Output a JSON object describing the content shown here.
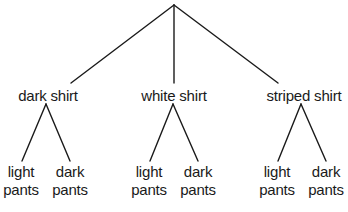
{
  "diagram": {
    "type": "tree",
    "line_color": "#1a1a1a",
    "root": {
      "label": ""
    },
    "shirts": [
      {
        "label": "dark shirt",
        "children": [
          {
            "line1": "light",
            "line2": "pants"
          },
          {
            "line1": "dark",
            "line2": "pants"
          }
        ]
      },
      {
        "label": "white shirt",
        "children": [
          {
            "line1": "light",
            "line2": "pants"
          },
          {
            "line1": "dark",
            "line2": "pants"
          }
        ]
      },
      {
        "label": "striped shirt",
        "children": [
          {
            "line1": "light",
            "line2": "pants"
          },
          {
            "line1": "dark",
            "line2": "pants"
          }
        ]
      }
    ]
  }
}
